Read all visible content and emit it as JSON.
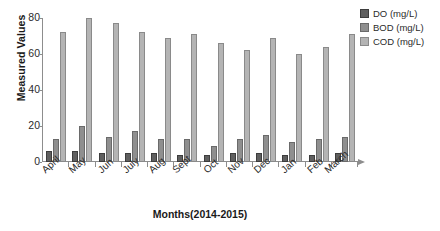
{
  "chart_data": {
    "type": "bar",
    "title": "",
    "xlabel": "Months(2014-2015)",
    "ylabel": "Measured Values",
    "categories": [
      "April",
      "May",
      "Jun",
      "July",
      "Aug",
      "Sept",
      "Oct",
      "Nov",
      "Dec",
      "Jan",
      "Feb",
      "March"
    ],
    "series": [
      {
        "name": "DO (mg/L)",
        "color": "#5f5f5f",
        "values": [
          6,
          6,
          5,
          5,
          5,
          4,
          4,
          5,
          5,
          4,
          4,
          5
        ]
      },
      {
        "name": "BOD (mg/L)",
        "color": "#8f8f8f",
        "values": [
          13,
          20,
          14,
          17,
          13,
          13,
          9,
          13,
          15,
          11,
          13,
          14
        ]
      },
      {
        "name": "COD (mg/L)",
        "color": "#b4b4b4",
        "values": [
          72,
          80,
          77,
          72,
          69,
          71,
          66,
          62,
          69,
          60,
          64,
          71
        ]
      }
    ],
    "ylim": [
      0,
      80
    ],
    "yticks": [
      0,
      20,
      40,
      60,
      80
    ],
    "grid": false,
    "legend_position": "right"
  }
}
